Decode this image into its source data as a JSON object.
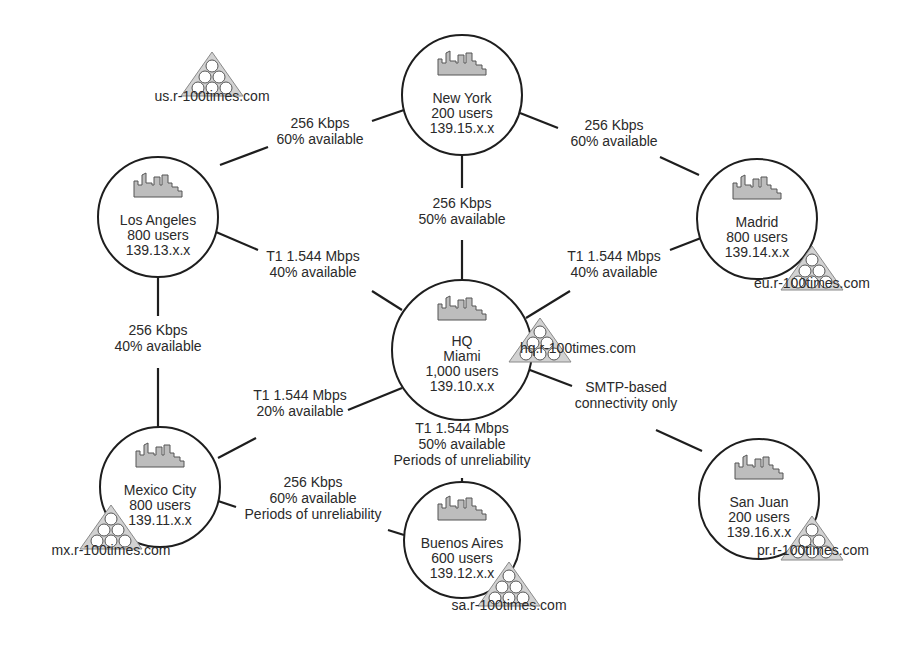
{
  "diagram": {
    "type": "network-topology",
    "nodes": [
      {
        "id": "ny",
        "name": "New York",
        "users": "200 users",
        "subnet": "139.15.x.x",
        "icon": "building-icon",
        "cx": 462,
        "cy": 95,
        "r": 60
      },
      {
        "id": "la",
        "name": "Los Angeles",
        "users": "800 users",
        "subnet": "139.13.x.x",
        "icon": "building-icon",
        "cx": 158,
        "cy": 217,
        "r": 60
      },
      {
        "id": "madrid",
        "name": "Madrid",
        "users": "800 users",
        "subnet": "139.14.x.x",
        "icon": "building-icon",
        "cx": 757,
        "cy": 219,
        "r": 60
      },
      {
        "id": "hq",
        "title": "HQ",
        "name": "Miami",
        "users": "1,000 users",
        "subnet": "139.10.x.x",
        "icon": "building-icon",
        "cx": 462,
        "cy": 350,
        "r": 70
      },
      {
        "id": "mx",
        "name": "Mexico City",
        "users": "800 users",
        "subnet": "139.11.x.x",
        "icon": "building-icon",
        "cx": 160,
        "cy": 487,
        "r": 60
      },
      {
        "id": "ba",
        "name": "Buenos Aires",
        "users": "600 users",
        "subnet": "139.12.x.x",
        "icon": "building-icon",
        "cx": 462,
        "cy": 540,
        "r": 58
      },
      {
        "id": "sj",
        "name": "San Juan",
        "users": "200 users",
        "subnet": "139.16.x.x",
        "icon": "building-icon",
        "cx": 759,
        "cy": 499,
        "r": 60
      }
    ],
    "domains": [
      {
        "id": "us",
        "label": "us.r-100times.com",
        "icon": "domain-tree-icon",
        "tx": 212,
        "ty": 52,
        "lx": 212,
        "ly": 101
      },
      {
        "id": "eu",
        "label": "eu.r-100times.com",
        "icon": "domain-tree-icon",
        "tx": 812,
        "ty": 246,
        "lx": 812,
        "ly": 288
      },
      {
        "id": "hq",
        "label": "hq.r-100times.com",
        "icon": "domain-tree-icon",
        "tx": 540,
        "ty": 318,
        "lx": 578,
        "ly": 353
      },
      {
        "id": "mx",
        "label": "mx.r-100times.com",
        "icon": "domain-tree-icon",
        "tx": 111,
        "ty": 505,
        "lx": 111,
        "ly": 555
      },
      {
        "id": "sa",
        "label": "sa.r-100times.com",
        "icon": "domain-tree-icon",
        "tx": 509,
        "ty": 562,
        "lx": 509,
        "ly": 610
      },
      {
        "id": "pr",
        "label": "pr.r-100times.com",
        "icon": "domain-tree-icon",
        "tx": 812,
        "ty": 516,
        "lx": 813,
        "ly": 555
      }
    ],
    "links": [
      {
        "from": "ny",
        "to": "la",
        "lines": [
          "256 Kbps",
          "60% available"
        ],
        "lx": 320,
        "ly": 128,
        "segs": [
          [
            404,
            110,
            372,
            121
          ],
          [
            268,
            147,
            220,
            165
          ]
        ]
      },
      {
        "from": "ny",
        "to": "madrid",
        "lines": [
          "256 Kbps",
          "60% available"
        ],
        "lx": 614,
        "ly": 130,
        "segs": [
          [
            520,
            113,
            558,
            128
          ],
          [
            660,
            157,
            699,
            175
          ]
        ]
      },
      {
        "from": "ny",
        "to": "hq",
        "lines": [
          "256 Kbps",
          "50% available"
        ],
        "lx": 462,
        "ly": 208,
        "segs": [
          [
            462,
            155,
            462,
            188
          ],
          [
            462,
            240,
            462,
            280
          ]
        ]
      },
      {
        "from": "la",
        "to": "hq",
        "lines": [
          "T1 1.544 Mbps",
          "40% available"
        ],
        "lx": 313,
        "ly": 261,
        "segs": [
          [
            216,
            232,
            258,
            250
          ],
          [
            372,
            291,
            402,
            310
          ]
        ]
      },
      {
        "from": "madrid",
        "to": "hq",
        "lines": [
          "T1 1.544 Mbps",
          "40% available"
        ],
        "lx": 614,
        "ly": 261,
        "segs": [
          [
            701,
            238,
            670,
            250
          ],
          [
            570,
            291,
            526,
            318
          ]
        ]
      },
      {
        "from": "la",
        "to": "mx",
        "lines": [
          "256 Kbps",
          "40% available"
        ],
        "lx": 158,
        "ly": 335,
        "segs": [
          [
            158,
            277,
            158,
            316
          ],
          [
            158,
            368,
            158,
            427
          ]
        ]
      },
      {
        "from": "hq",
        "to": "mx",
        "lines": [
          "T1 1.544 Mbps",
          "20% available"
        ],
        "lx": 300,
        "ly": 400,
        "segs": [
          [
            402,
            388,
            348,
            410
          ],
          [
            256,
            438,
            218,
            458
          ]
        ]
      },
      {
        "from": "hq",
        "to": "ba",
        "lines": [
          "T1 1.544 Mbps",
          "50% available",
          "Periods of unreliability"
        ],
        "lx": 462,
        "ly": 433,
        "segs": [
          [
            462,
            420,
            462,
            412
          ],
          [
            462,
            478,
            462,
            482
          ]
        ]
      },
      {
        "from": "mx",
        "to": "ba",
        "lines": [
          "256 Kbps",
          "60% available",
          "Periods of unreliability"
        ],
        "lx": 313,
        "ly": 487,
        "segs": [
          [
            218,
            501,
            236,
            507
          ],
          [
            388,
            530,
            404,
            535
          ]
        ]
      },
      {
        "from": "hq",
        "to": "sj",
        "lines": [
          "SMTP-based",
          "connectivity only"
        ],
        "lx": 626,
        "ly": 392,
        "segs": [
          [
            522,
            367,
            572,
            386
          ],
          [
            656,
            430,
            702,
            451
          ]
        ]
      }
    ]
  }
}
